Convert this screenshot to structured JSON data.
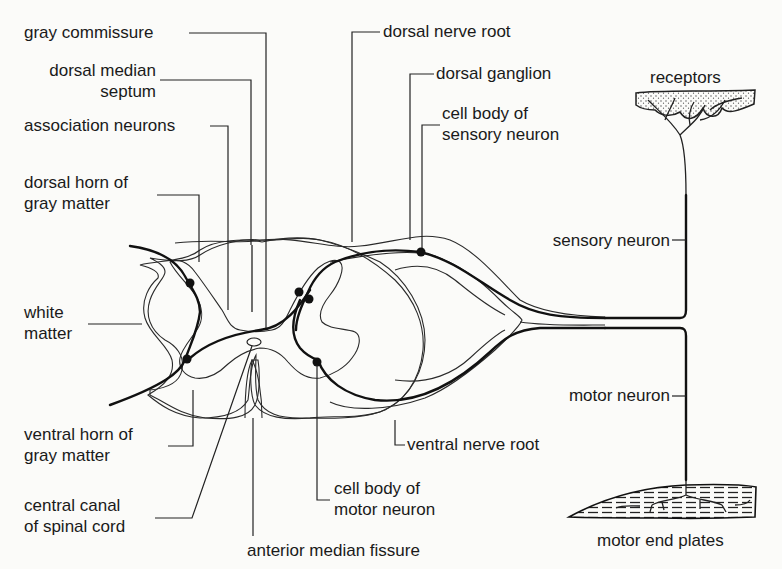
{
  "diagram": {
    "labels": {
      "gray_commissure": "gray commissure",
      "dorsal_median_septum": [
        "dorsal median",
        "septum"
      ],
      "association_neurons": "association neurons",
      "dorsal_horn": [
        "dorsal horn of",
        "gray matter"
      ],
      "white_matter": [
        "white",
        "matter"
      ],
      "ventral_horn": [
        "ventral horn of",
        "gray matter"
      ],
      "central_canal": [
        "central canal",
        "of spinal cord"
      ],
      "anterior_median_fissure": "anterior median fissure",
      "cell_body_motor": [
        "cell body of",
        "motor neuron"
      ],
      "ventral_nerve_root": "ventral nerve root",
      "dorsal_nerve_root": "dorsal nerve root",
      "dorsal_ganglion": "dorsal ganglion",
      "cell_body_sensory": [
        "cell body of",
        "sensory neuron"
      ],
      "receptors": "receptors",
      "sensory_neuron": "sensory neuron",
      "motor_neuron": "motor neuron",
      "motor_end_plates": "motor end plates"
    },
    "colors": {
      "ink": "#1a1a1a",
      "background": "#fbfbf9",
      "stipple": "#555555"
    }
  }
}
